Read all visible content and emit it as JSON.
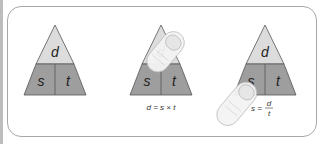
{
  "colors": {
    "top_fill": "#dcdcdc",
    "bottom_fill": "#9e9e9e",
    "stroke": "#555555",
    "border": "#a8a8a8"
  },
  "triangles": [
    {
      "top": "d",
      "bottom_left": "s",
      "bottom_right": "t",
      "covered": "none",
      "formula": ""
    },
    {
      "top": "d",
      "bottom_left": "s",
      "bottom_right": "t",
      "covered": "d",
      "formula": "d = s × t"
    },
    {
      "top": "d",
      "bottom_left": "s",
      "bottom_right": "t",
      "covered": "s",
      "formula_lhs": "s =",
      "formula_num": "d",
      "formula_den": "t"
    }
  ]
}
